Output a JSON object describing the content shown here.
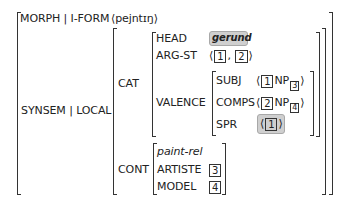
{
  "avm": {
    "morph_path": "MORPH | I-FORM",
    "morph_value": "⟨pejntɪŋ⟩",
    "synsem_path": "SYNSEM | LOCAL",
    "cat": {
      "label": "CAT",
      "head": {
        "label": "HEAD",
        "value": "gerund",
        "highlighted": true
      },
      "arg_st": {
        "label": "ARG-ST",
        "open": "⟨",
        "tag1": "1",
        "sep": ",",
        "tag2": "2",
        "close": "⟩"
      },
      "valence": {
        "label": "VALENCE",
        "subj": {
          "label": "SUBJ",
          "open": "⟨",
          "tag": "1",
          "cat": "NP",
          "index": "3",
          "close": "⟩"
        },
        "comps": {
          "label": "COMPS",
          "open": "⟨",
          "tag": "2",
          "cat": "NP",
          "index": "4",
          "close": "⟩"
        },
        "spr": {
          "label": "SPR",
          "open": "⟨",
          "tag": "1",
          "close": "⟩",
          "highlighted": true
        }
      }
    },
    "cont": {
      "label": "CONT",
      "type": "paint-rel",
      "artiste": {
        "label": "ARTISTE",
        "tag": "3"
      },
      "model": {
        "label": "MODEL",
        "tag": "4"
      }
    }
  },
  "colors": {
    "highlight_fill": "#cfcfcf",
    "highlight_border": "#a8a8a8",
    "ink": "#222222"
  }
}
